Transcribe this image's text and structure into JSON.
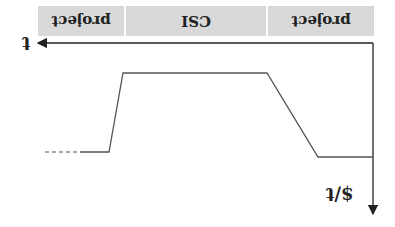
{
  "diagram": {
    "orientation": "rotated-180",
    "phases": [
      {
        "label": "project",
        "x": 38,
        "width": 86
      },
      {
        "label": "CSI",
        "x": 126,
        "width": 140
      },
      {
        "label": "project",
        "x": 268,
        "width": 106
      }
    ],
    "axes": {
      "x_label": "t",
      "y_label": "$/t"
    },
    "curve": {
      "dashed_start": [
        [
          45,
          152
        ],
        [
          80,
          152
        ]
      ],
      "points": [
        [
          80,
          152
        ],
        [
          109,
          152
        ],
        [
          123,
          73
        ],
        [
          267,
          73
        ],
        [
          318,
          157
        ],
        [
          373,
          157
        ]
      ]
    },
    "colors": {
      "phase_fill": "#d9d9d9",
      "line": "#555555",
      "axis": "#222222"
    }
  }
}
